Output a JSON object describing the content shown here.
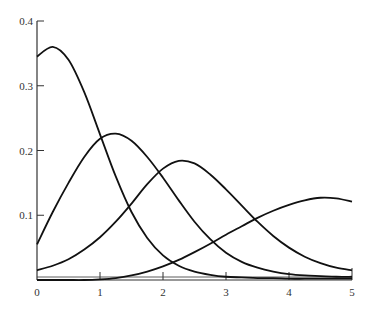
{
  "chart_data": {
    "type": "line",
    "title": "",
    "xlabel": "",
    "ylabel": "",
    "xlim": [
      0,
      5
    ],
    "ylim": [
      0,
      0.4
    ],
    "grid": false,
    "legend": null,
    "x_ticks": [
      "0",
      "1",
      "2",
      "3",
      "4",
      "5"
    ],
    "y_ticks": [
      "0.1",
      "0.2",
      "0.3",
      "0.4"
    ],
    "x": [
      0,
      0.25,
      0.5,
      0.75,
      1.0,
      1.25,
      1.5,
      1.75,
      2.0,
      2.25,
      2.5,
      2.75,
      3.0,
      3.25,
      3.5,
      3.75,
      4.0,
      4.25,
      4.5,
      4.75,
      5.0
    ],
    "series": [
      {
        "name": "curve-1",
        "values": [
          0.345,
          0.36,
          0.34,
          0.29,
          0.225,
          0.16,
          0.105,
          0.065,
          0.038,
          0.022,
          0.013,
          0.008,
          0.005,
          0.004,
          0.003,
          0.003,
          0.002,
          0.002,
          0.002,
          0.002,
          0.002
        ]
      },
      {
        "name": "curve-2",
        "values": [
          0.055,
          0.105,
          0.15,
          0.19,
          0.218,
          0.226,
          0.215,
          0.19,
          0.158,
          0.123,
          0.09,
          0.063,
          0.042,
          0.028,
          0.019,
          0.013,
          0.009,
          0.007,
          0.006,
          0.005,
          0.005
        ]
      },
      {
        "name": "curve-3",
        "values": [
          0.015,
          0.022,
          0.032,
          0.047,
          0.066,
          0.09,
          0.118,
          0.148,
          0.172,
          0.184,
          0.18,
          0.163,
          0.14,
          0.115,
          0.09,
          0.068,
          0.05,
          0.036,
          0.026,
          0.019,
          0.015
        ]
      },
      {
        "name": "curve-4",
        "values": [
          0.0,
          0.0,
          0.0,
          0.0,
          0.001,
          0.003,
          0.007,
          0.013,
          0.021,
          0.031,
          0.043,
          0.056,
          0.07,
          0.083,
          0.096,
          0.107,
          0.116,
          0.123,
          0.127,
          0.126,
          0.121
        ]
      }
    ]
  }
}
